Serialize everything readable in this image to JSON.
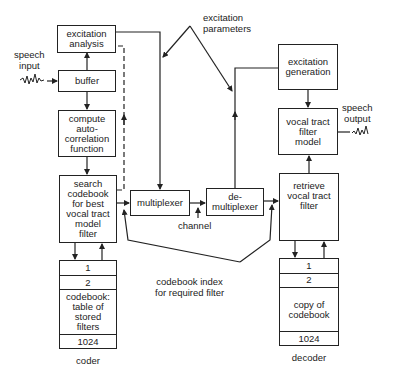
{
  "coder": {
    "label": "coder",
    "speech_input": "speech\ninput",
    "excitation_analysis": "excitation\nanalysis",
    "buffer": "buffer",
    "autocorrelation": "compute\nauto-\ncorrelation\nfunction",
    "search_codebook": "search\ncodebook\nfor best\nvocal tract\nmodel\nfilter",
    "codebook_rows": [
      "1",
      "2",
      "codebook:\ntable of\nstored\nfilters",
      "1024"
    ]
  },
  "channel": {
    "multiplexer": "multiplexer",
    "demultiplexer": "de-\nmultiplexer",
    "channel_label": "channel",
    "excitation_parameters": "excitation\nparameters",
    "codebook_index": "codebook index\nfor required filter"
  },
  "decoder": {
    "label": "decoder",
    "excitation_generation": "excitation\ngeneration",
    "vocal_tract_filter": "vocal tract\nfilter\nmodel",
    "speech_output": "speech\noutput",
    "retrieve_filter": "retrieve\nvocal tract\nfilter",
    "codebook_rows": [
      "1",
      "2",
      "copy of\ncodebook",
      "1024"
    ]
  }
}
